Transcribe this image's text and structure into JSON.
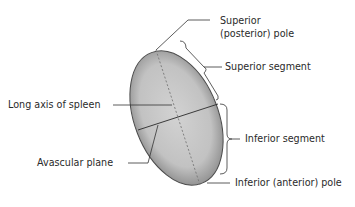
{
  "figure": {
    "labels": {
      "superior_pole_line1": "Superior",
      "superior_pole_line2": "(posterior) pole",
      "superior_segment": "Superior segment",
      "long_axis": "Long axis of spleen",
      "inferior_segment": "Inferior segment",
      "avascular_plane": "Avascular plane",
      "inferior_pole": "Inferior (anterior) pole"
    },
    "colors": {
      "organ_fill": "#c4c4c4",
      "organ_edge": "#5a5a5a",
      "line": "#333333",
      "text": "#2a2a2a",
      "background": "#ffffff"
    }
  }
}
